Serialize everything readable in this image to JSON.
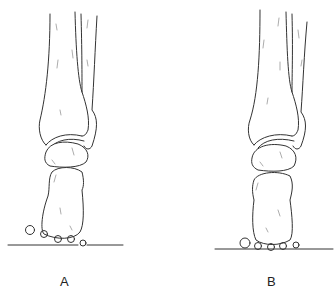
{
  "figure": {
    "panels": [
      {
        "id": "A",
        "label": "A"
      },
      {
        "id": "B",
        "label": "B"
      }
    ],
    "colors": {
      "line": "#333333",
      "background": "#ffffff"
    }
  }
}
